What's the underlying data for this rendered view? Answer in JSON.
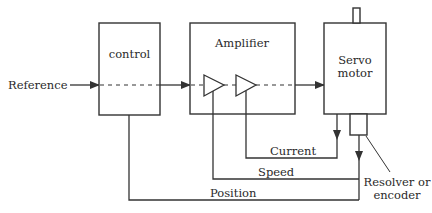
{
  "diagram": {
    "type": "servo-control-block-diagram",
    "input_label": "Reference",
    "blocks": {
      "control": {
        "label": "control"
      },
      "amplifier": {
        "label": "Amplifier"
      },
      "servo_motor": {
        "label_line1": "Servo",
        "label_line2": "motor"
      },
      "sensor": {
        "label_line1": "Resolver or",
        "label_line2": "encoder"
      }
    },
    "feedback_loops": {
      "current": "Current",
      "speed": "Speed",
      "position": "Position"
    },
    "colors": {
      "line": "#333333",
      "background": "#ffffff"
    }
  }
}
